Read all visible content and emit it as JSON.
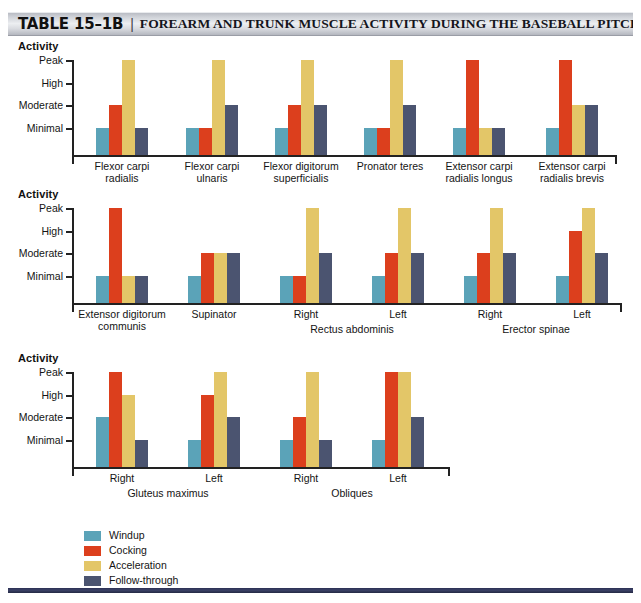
{
  "header": {
    "table_number": "TABLE 15–1B",
    "separator": "|",
    "title": "FOREARM AND TRUNK MUSCLE ACTIVITY DURING THE BASEBALL PITCH*"
  },
  "axis": {
    "y_title": "Activity",
    "y_ticks": [
      "Peak",
      "High",
      "Moderate",
      "Minimal"
    ]
  },
  "legend": {
    "items": [
      {
        "label": "Windup",
        "color": "#5ba3b8",
        "key": "windup"
      },
      {
        "label": "Cocking",
        "color": "#dc3f1d",
        "key": "cocking"
      },
      {
        "label": "Acceleration",
        "color": "#e3c668",
        "key": "acceleration"
      },
      {
        "label": "Follow-through",
        "color": "#4b5470",
        "key": "followthrough"
      }
    ]
  },
  "chart_data": [
    {
      "type": "bar",
      "title": "Forearm muscle activity (row 1)",
      "xlabel": "",
      "ylabel": "Activity",
      "ylim": [
        "Baseline",
        "Peak"
      ],
      "y_tick_labels": [
        "Peak",
        "High",
        "Moderate",
        "Minimal"
      ],
      "grid": false,
      "legend_position": "bottom",
      "series": [
        {
          "name": "Windup",
          "values": [
            "Minimal",
            "Minimal",
            "Minimal",
            "Minimal",
            "Minimal",
            "Minimal"
          ]
        },
        {
          "name": "Cocking",
          "values": [
            "Moderate",
            "Minimal",
            "Moderate",
            "Minimal",
            "Peak",
            "Peak"
          ]
        },
        {
          "name": "Acceleration",
          "values": [
            "Peak",
            "Peak",
            "Peak",
            "Peak",
            "Minimal",
            "Moderate"
          ]
        },
        {
          "name": "Follow-through",
          "values": [
            "Minimal",
            "Moderate",
            "Moderate",
            "Moderate",
            "Minimal",
            "Moderate"
          ]
        }
      ],
      "categories": [
        "Flexor carpi\nradialis",
        "Flexor carpi\nulnaris",
        "Flexor digitorum\nsuperficialis",
        "Pronator teres",
        "Extensor carpi\nradialis longus",
        "Extensor carpi\nradialis brevis"
      ],
      "group_brackets": []
    },
    {
      "type": "bar",
      "title": "Forearm and trunk muscle activity (row 2)",
      "xlabel": "",
      "ylabel": "Activity",
      "ylim": [
        "Baseline",
        "Peak"
      ],
      "y_tick_labels": [
        "Peak",
        "High",
        "Moderate",
        "Minimal"
      ],
      "grid": false,
      "legend_position": "bottom",
      "series": [
        {
          "name": "Windup",
          "values": [
            "Minimal",
            "Minimal",
            "Minimal",
            "Minimal",
            "Minimal",
            "Minimal"
          ]
        },
        {
          "name": "Cocking",
          "values": [
            "Peak",
            "Moderate",
            "Minimal",
            "Moderate",
            "Moderate",
            "High"
          ]
        },
        {
          "name": "Acceleration",
          "values": [
            "Minimal",
            "Moderate",
            "Peak",
            "Peak",
            "Peak",
            "Peak"
          ]
        },
        {
          "name": "Follow-through",
          "values": [
            "Minimal",
            "Moderate",
            "Moderate",
            "Moderate",
            "Moderate",
            "Moderate"
          ]
        }
      ],
      "categories": [
        "Extensor digitorum\ncommunis",
        "Supinator",
        "Right",
        "Left",
        "Right",
        "Left"
      ],
      "group_brackets": [
        {
          "label": "Rectus abdominis",
          "covers": [
            2,
            3
          ]
        },
        {
          "label": "Erector spinae",
          "covers": [
            4,
            5
          ]
        }
      ]
    },
    {
      "type": "bar",
      "title": "Trunk and hip muscle activity (row 3)",
      "xlabel": "",
      "ylabel": "Activity",
      "ylim": [
        "Baseline",
        "Peak"
      ],
      "y_tick_labels": [
        "Peak",
        "High",
        "Moderate",
        "Minimal"
      ],
      "grid": false,
      "legend_position": "bottom",
      "series": [
        {
          "name": "Windup",
          "values": [
            "Moderate",
            "Minimal",
            "Minimal",
            "Minimal"
          ]
        },
        {
          "name": "Cocking",
          "values": [
            "Peak",
            "High",
            "Moderate",
            "Peak"
          ]
        },
        {
          "name": "Acceleration",
          "values": [
            "High",
            "Peak",
            "Peak",
            "Peak"
          ]
        },
        {
          "name": "Follow-through",
          "values": [
            "Minimal",
            "Moderate",
            "Minimal",
            "Moderate"
          ]
        }
      ],
      "categories": [
        "Right",
        "Left",
        "Right",
        "Left"
      ],
      "group_brackets": [
        {
          "label": "Gluteus maximus",
          "covers": [
            0,
            1
          ]
        },
        {
          "label": "Obliques",
          "covers": [
            2,
            3
          ]
        }
      ]
    }
  ]
}
